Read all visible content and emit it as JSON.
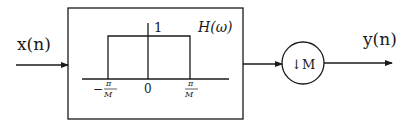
{
  "diagram": {
    "input_label": "x(n)",
    "output_label": "y(n)",
    "filter_block": {
      "title": "H(ω)",
      "peak_label": "1",
      "ticks": {
        "left": {
          "sign": "−",
          "num": "π",
          "den": "M"
        },
        "center": "0",
        "right": {
          "num": "π",
          "den": "M"
        }
      }
    },
    "downsampler": {
      "arrow": "↓",
      "factor": "M"
    },
    "colors": {
      "line": "#1a1a1a",
      "background": "#ffffff"
    }
  }
}
